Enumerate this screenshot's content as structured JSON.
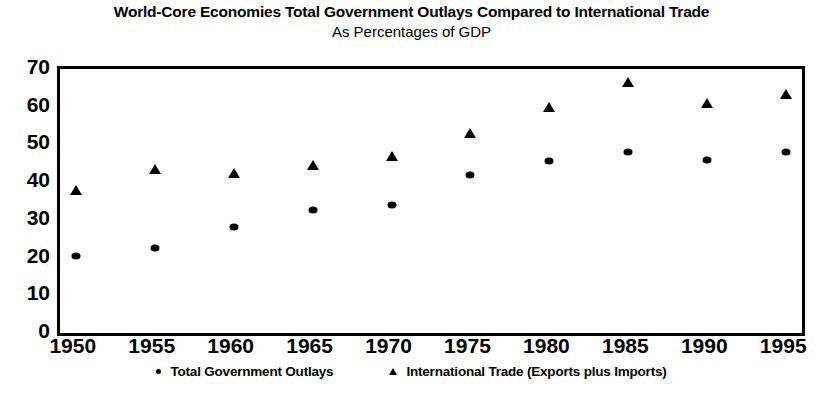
{
  "chart_data": {
    "type": "scatter",
    "title": "World-Core Economies Total Government Outlays Compared to International Trade",
    "subtitle": "As Percentages of GDP",
    "xlabel": "",
    "ylabel": "",
    "x": [
      1950,
      1955,
      1960,
      1965,
      1970,
      1975,
      1980,
      1985,
      1990,
      1995
    ],
    "xtick_labels": [
      "1950",
      "1955",
      "1960",
      "1965",
      "1970",
      "1975",
      "1980",
      "1985",
      "1990",
      "1995"
    ],
    "ytick_labels": [
      "0",
      "10",
      "20",
      "30",
      "40",
      "50",
      "60",
      "70"
    ],
    "ytick_values": [
      0,
      10,
      20,
      30,
      40,
      50,
      60,
      70
    ],
    "xlim": [
      1949,
      1996
    ],
    "ylim": [
      0,
      70
    ],
    "grid": false,
    "legend_position": "bottom",
    "series": [
      {
        "name": "Total Government Outlays",
        "marker": "dot",
        "values": [
          20.5,
          22.5,
          28,
          32.5,
          34,
          42,
          45.5,
          48,
          46,
          48
        ]
      },
      {
        "name": "International Trade (Exports plus Imports)",
        "marker": "triangle",
        "values": [
          38,
          43.5,
          42.5,
          44.5,
          47,
          53,
          60,
          66.5,
          61,
          63.5
        ]
      }
    ]
  },
  "colors": {
    "ink": "#000000",
    "background": "#ffffff"
  }
}
